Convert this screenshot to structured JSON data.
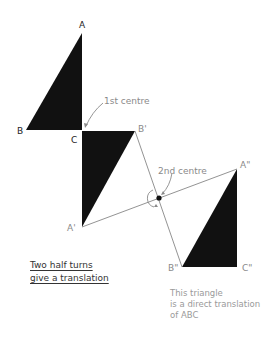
{
  "diagram": {
    "title": "Two half turns give a translation",
    "labels": {
      "A": "A",
      "B": "B",
      "C": "C",
      "A1": "A'",
      "B1": "B'",
      "A2": "A\"",
      "B2": "B\"",
      "C2": "C\""
    },
    "annotations": {
      "first_centre": "1st centre",
      "second_centre": "2nd centre"
    },
    "caption": {
      "line1": "Two half turns",
      "line2": "give a translation"
    },
    "note": {
      "line1": "This triangle",
      "line2": "is a direct translation",
      "line3": "of ABC"
    },
    "colors": {
      "triangle_fill": "#111111",
      "line": "#666666",
      "annotation": "#8a8a8a"
    }
  }
}
